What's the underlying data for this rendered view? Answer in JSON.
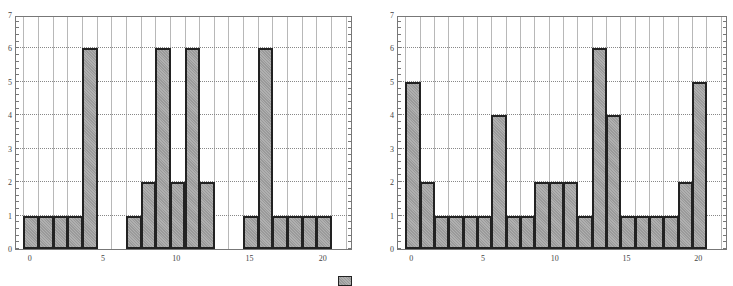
{
  "chart_data": [
    {
      "type": "bar",
      "title": "",
      "xlabel": "",
      "ylabel": "",
      "x": [
        0,
        1,
        2,
        3,
        4,
        5,
        6,
        7,
        8,
        9,
        10,
        11,
        12,
        13,
        14,
        15,
        16,
        17,
        18,
        19,
        20
      ],
      "values": [
        1,
        1,
        1,
        1,
        6,
        0,
        0,
        1,
        2,
        6,
        2,
        6,
        2,
        0,
        0,
        1,
        6,
        1,
        1,
        1,
        1
      ],
      "xlim": [
        -1,
        22
      ],
      "ylim": [
        0,
        7
      ],
      "xticks": [
        "0",
        "5",
        "10",
        "15",
        "20"
      ],
      "yticks": [
        "0",
        "1",
        "2",
        "3",
        "4",
        "5",
        "6",
        "7"
      ],
      "grid": true
    },
    {
      "type": "bar",
      "title": "",
      "xlabel": "",
      "ylabel": "",
      "x": [
        0,
        1,
        2,
        3,
        4,
        5,
        6,
        7,
        8,
        9,
        10,
        11,
        12,
        13,
        14,
        15,
        16,
        17,
        18,
        19,
        20
      ],
      "values": [
        5,
        2,
        1,
        1,
        1,
        1,
        4,
        1,
        1,
        2,
        2,
        2,
        1,
        6,
        4,
        1,
        1,
        1,
        1,
        2,
        5
      ],
      "xlim": [
        -1,
        22
      ],
      "ylim": [
        0,
        7
      ],
      "xticks": [
        "0",
        "5",
        "10",
        "15",
        "20"
      ],
      "yticks": [
        "0",
        "1",
        "2",
        "3",
        "4",
        "5",
        "6",
        "7"
      ],
      "grid": true
    }
  ],
  "legend": {
    "label": ""
  }
}
